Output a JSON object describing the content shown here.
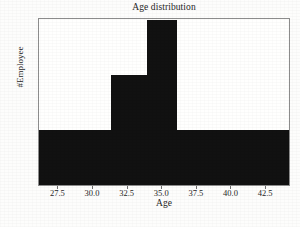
{
  "chart_data": {
    "type": "bar",
    "title": "Age distribution",
    "xlabel": "Age",
    "ylabel": "#Employee",
    "grid": false,
    "legend": null,
    "xlim": [
      26.1,
      44.3
    ],
    "ylim": [
      0,
      3.05
    ],
    "bin_edges": [
      26.1,
      28.7,
      31.3,
      33.9,
      36.1,
      38.7,
      41.3,
      44.3
    ],
    "categories": [
      "26.1-28.7",
      "28.7-31.3",
      "31.3-33.9",
      "33.9-36.1",
      "36.1-38.7",
      "38.7-41.3",
      "41.3-44.3"
    ],
    "values": [
      1,
      1,
      2,
      3,
      1,
      1,
      1
    ],
    "bars": [
      {
        "label": "bin-1",
        "x0": 26.1,
        "x1": 28.7,
        "value": 1
      },
      {
        "label": "bin-2",
        "x0": 28.7,
        "x1": 31.3,
        "value": 1
      },
      {
        "label": "bin-3",
        "x0": 31.3,
        "x1": 33.9,
        "value": 2
      },
      {
        "label": "bin-4",
        "x0": 33.9,
        "x1": 36.1,
        "value": 3
      },
      {
        "label": "bin-5",
        "x0": 36.1,
        "x1": 38.7,
        "value": 1
      },
      {
        "label": "bin-6",
        "x0": 38.7,
        "x1": 41.3,
        "value": 1
      },
      {
        "label": "bin-7",
        "x0": 41.3,
        "x1": 44.3,
        "value": 1
      }
    ],
    "xticks": [
      {
        "value": 27.5,
        "label": "27.5"
      },
      {
        "value": 30.0,
        "label": "30.0"
      },
      {
        "value": 32.5,
        "label": "32.5"
      },
      {
        "value": 35.0,
        "label": "35.0"
      },
      {
        "value": 37.5,
        "label": "37.5"
      },
      {
        "value": 40.0,
        "label": "40.0"
      },
      {
        "value": 42.5,
        "label": "42.5"
      }
    ],
    "yticks": [
      {
        "value": 0,
        "label": "0"
      },
      {
        "value": 0.5,
        "label": "0.5"
      },
      {
        "value": 1.0,
        "label": "1.0"
      },
      {
        "value": 1.5,
        "label": "1.5"
      },
      {
        "value": 2.0,
        "label": "2.0"
      },
      {
        "value": 2.5,
        "label": "2.5"
      },
      {
        "value": 3.0,
        "label": "3.0"
      }
    ],
    "colors": {
      "bar": "#111111",
      "background": "#fdfdfc",
      "plot_background": "#fffffe",
      "axis": "#8c8c8c",
      "text": "#262626"
    }
  }
}
